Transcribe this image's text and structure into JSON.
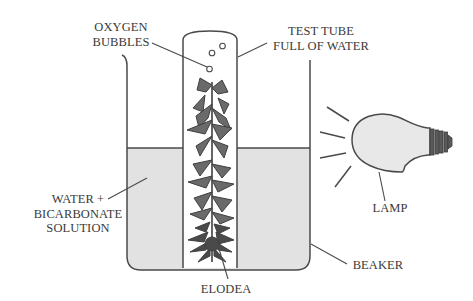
{
  "diagram": {
    "title": "",
    "colors": {
      "line": "#4a4a4a",
      "solution_fill": "#e2e2e2",
      "bulb_fill": "#e8e8e8",
      "plant": "#5a5a5a",
      "text": "#3a3a3a",
      "background": "#ffffff"
    },
    "labels": {
      "oxygen_bubbles": {
        "line1": "OXYGEN",
        "line2": "BUBBLES"
      },
      "test_tube": {
        "line1": "TEST TUBE",
        "line2": "FULL OF WATER"
      },
      "solution": {
        "line1": "WATER +",
        "line2": "BICARBONATE",
        "line3": "SOLUTION"
      },
      "elodea": "ELODEA",
      "beaker": "BEAKER",
      "lamp": "LAMP"
    },
    "components": [
      "beaker",
      "test-tube",
      "oxygen-bubbles",
      "elodea-plant",
      "water-bicarbonate-solution",
      "lamp",
      "light-rays"
    ]
  }
}
